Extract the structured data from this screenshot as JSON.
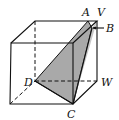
{
  "diagram": {
    "type": "cube-cross-section",
    "labels": {
      "A": "A",
      "V": "V",
      "B": "B",
      "D": "D",
      "W": "W",
      "C": "C"
    },
    "colors": {
      "section_fill": "#a9a9a9",
      "side_face_fill": "#c8c8c8",
      "edge": "#111111"
    }
  }
}
